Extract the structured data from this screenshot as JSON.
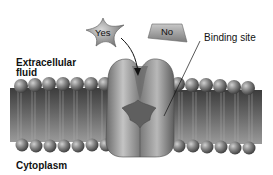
{
  "diagram": {
    "type": "membrane-receptor-binding",
    "ligands": [
      {
        "id": "yes",
        "label": "Yes",
        "shape": "star",
        "fits_binding_site": true
      },
      {
        "id": "no",
        "label": "No",
        "shape": "trapezoid",
        "fits_binding_site": false
      }
    ],
    "labels": {
      "extracellular_line1": "Extracellular",
      "extracellular_line2": "fluid",
      "binding_site": "Binding site",
      "cytoplasm": "Cytoplasm"
    },
    "colors": {
      "protein": "#8a8a8a",
      "protein_dark": "#5a5a5a",
      "phospholipid_head": "#7a7a7a",
      "membrane_core": "#4a4a4a",
      "background": "#ffffff"
    }
  }
}
